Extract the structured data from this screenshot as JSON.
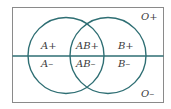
{
  "diagram": {
    "type": "venn",
    "title": "",
    "colors": {
      "circle_stroke": "#2e6e73",
      "axis_line": "#2e6e73",
      "frame_stroke": "#8a8a8a",
      "text": "#3a3a3a"
    },
    "sets": [
      {
        "name": "A",
        "cx": 66,
        "cy": 55.5,
        "r": 38
      },
      {
        "name": "B",
        "cx": 108,
        "cy": 55.5,
        "r": 38
      }
    ],
    "divider": {
      "name": "Rh",
      "y": 56
    },
    "frame": {
      "x": 12,
      "y": 7,
      "width": 151,
      "height": 95
    },
    "labels": {
      "a_pos": "A+",
      "a_neg": "A–",
      "ab_pos": "AB+",
      "ab_neg": "AB–",
      "b_pos": "B+",
      "b_neg": "B–",
      "o_pos": "O+",
      "o_neg": "O–"
    }
  }
}
